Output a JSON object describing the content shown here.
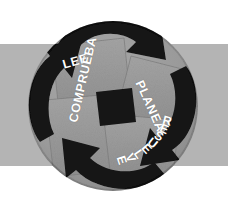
{
  "canvas": {
    "width": 228,
    "height": 207,
    "background_color": "#ffffff"
  },
  "band": {
    "color": "#b4b4b4",
    "top": 44,
    "height": 122
  },
  "diagram": {
    "kind": "cycle-wheel",
    "title_text": "",
    "circle": {
      "center_x": 113,
      "center_y": 106,
      "radius": 85,
      "fill_color": "#9a9a9a",
      "rim_color": "#8e8e8e"
    },
    "arrow_color": "#141414",
    "panel_color": "#9c9c9c",
    "panel_shadow_color": "#7d7d7d",
    "rotation_direction": "clockwise",
    "steps": [
      {
        "id": "lee",
        "label": "LEE",
        "position": "top-left",
        "angle_deg": -16
      },
      {
        "id": "planea",
        "label": "PLANEA",
        "position": "top-right",
        "angle_deg": 66
      },
      {
        "id": "resuelve",
        "label": "RESUELVE",
        "position": "bottom-right",
        "angle_deg": 20
      },
      {
        "id": "comprueba",
        "label": "COMPRUEBA",
        "position": "bottom-left",
        "angle_deg": -77
      }
    ]
  },
  "arc_text": {
    "resuelve": {
      "text": "RESUELVE",
      "radius": 58,
      "start_angle_deg": 14,
      "char_step_deg": 8.2
    }
  }
}
